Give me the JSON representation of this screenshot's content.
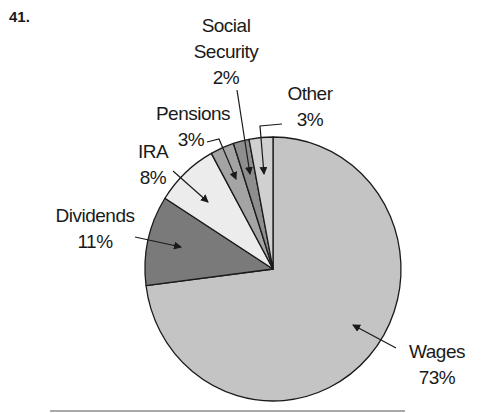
{
  "problem_number": "41.",
  "chart_data": {
    "type": "pie",
    "title": "",
    "start_angle_deg": 0,
    "direction": "clockwise",
    "slices": [
      {
        "label": "Wages",
        "value": 73,
        "value_label": "73%",
        "color": "#c4c4c4"
      },
      {
        "label": "Dividends",
        "value": 11,
        "value_label": "11%",
        "color": "#7a7a7a"
      },
      {
        "label": "IRA",
        "value": 8,
        "value_label": "8%",
        "color": "#ececec"
      },
      {
        "label": "Pensions",
        "value": 3,
        "value_label": "3%",
        "color": "#a4a4a4"
      },
      {
        "label": "Social Security",
        "value": 2,
        "value_label": "2%",
        "color": "#8e8e8e"
      },
      {
        "label": "Other",
        "value": 3,
        "value_label": "3%",
        "color": "#d0d0d0"
      }
    ]
  },
  "labels": {
    "wages": {
      "name": "Wages",
      "pct": "73%"
    },
    "dividends": {
      "name": "Dividends",
      "pct": "11%"
    },
    "ira": {
      "name": "IRA",
      "pct": "8%"
    },
    "pensions": {
      "name": "Pensions",
      "pct": "3%"
    },
    "social_security": {
      "name_line1": "Social",
      "name_line2": "Security",
      "pct": "2%"
    },
    "other": {
      "name": "Other",
      "pct": "3%"
    }
  }
}
